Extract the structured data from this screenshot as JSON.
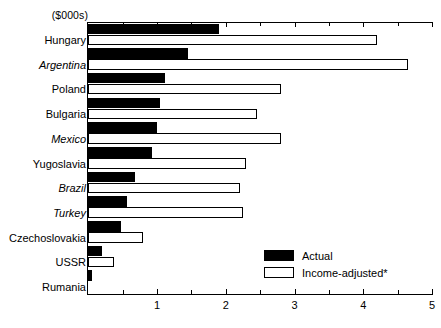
{
  "chart_data": {
    "type": "bar",
    "orientation": "horizontal",
    "title": "",
    "subtitle": "",
    "unit_label": "($000s)",
    "xlabel": "",
    "ylabel": "",
    "xlim": [
      0,
      5
    ],
    "grid": false,
    "legend_position": "inside-bottom-right",
    "categories": [
      "Hungary",
      "Argentina",
      "Poland",
      "Bulgaria",
      "Mexico",
      "Yugoslavia",
      "Brazil",
      "Turkey",
      "Czechoslovakia",
      "USSR",
      "Rumania"
    ],
    "categories_italic": [
      false,
      true,
      false,
      false,
      true,
      false,
      true,
      true,
      false,
      false,
      false
    ],
    "series": [
      {
        "name": "Actual",
        "color": "#000000",
        "values": [
          1.9,
          1.45,
          1.12,
          1.05,
          1.0,
          0.93,
          0.68,
          0.57,
          0.47,
          0.2,
          0.05
        ]
      },
      {
        "name": "Income-adjusted*",
        "color": "#ffffff",
        "values": [
          4.2,
          4.65,
          2.8,
          2.45,
          2.8,
          2.3,
          2.2,
          2.25,
          0.8,
          0.37,
          0.0
        ]
      }
    ],
    "major_ticks": [
      1,
      2,
      3,
      4,
      5
    ],
    "minor_ticks": [
      0.5,
      1.5,
      2.5,
      3.5,
      4.5
    ],
    "tick_labels": [
      "1",
      "2",
      "3",
      "4",
      "5"
    ]
  },
  "legend": {
    "items": [
      {
        "label": "Actual",
        "style": "actual"
      },
      {
        "label": "Income-adjusted*",
        "style": "adj"
      }
    ]
  }
}
